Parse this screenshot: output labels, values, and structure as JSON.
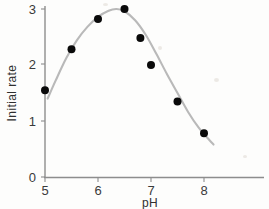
{
  "chart_data": {
    "type": "scatter",
    "title": "",
    "xlabel": "pH",
    "ylabel": "Initial rate",
    "xlim": [
      4.72,
      8.85
    ],
    "ylim": [
      0,
      3.12
    ],
    "xticks": [
      5,
      6,
      7,
      8
    ],
    "xtick_labels": [
      "5",
      "6",
      "7",
      "8"
    ],
    "yticks": [
      0,
      1,
      2,
      3
    ],
    "ytick_labels": [
      "0",
      "1",
      "2",
      "3"
    ],
    "grid": false,
    "legend": "none",
    "marker_color": "#0a0a0a",
    "curve_color": "#b9b9b9",
    "axis_color": "#8d8d8d",
    "points": [
      {
        "x": 5.0,
        "y": 1.55
      },
      {
        "x": 5.5,
        "y": 2.28
      },
      {
        "x": 6.0,
        "y": 2.82
      },
      {
        "x": 6.5,
        "y": 3.0
      },
      {
        "x": 6.8,
        "y": 2.48
      },
      {
        "x": 7.0,
        "y": 2.0
      },
      {
        "x": 7.5,
        "y": 1.35
      },
      {
        "x": 8.0,
        "y": 0.78
      }
    ],
    "fit_curve": [
      {
        "x": 5.05,
        "y": 1.4
      },
      {
        "x": 5.2,
        "y": 1.72
      },
      {
        "x": 5.4,
        "y": 2.12
      },
      {
        "x": 5.6,
        "y": 2.44
      },
      {
        "x": 5.8,
        "y": 2.68
      },
      {
        "x": 6.0,
        "y": 2.86
      },
      {
        "x": 6.2,
        "y": 2.97
      },
      {
        "x": 6.35,
        "y": 3.0
      },
      {
        "x": 6.5,
        "y": 2.96
      },
      {
        "x": 6.7,
        "y": 2.8
      },
      {
        "x": 6.9,
        "y": 2.54
      },
      {
        "x": 7.1,
        "y": 2.2
      },
      {
        "x": 7.3,
        "y": 1.84
      },
      {
        "x": 7.5,
        "y": 1.5
      },
      {
        "x": 7.7,
        "y": 1.16
      },
      {
        "x": 7.9,
        "y": 0.88
      },
      {
        "x": 8.1,
        "y": 0.66
      },
      {
        "x": 8.18,
        "y": 0.58
      }
    ]
  },
  "axes": {
    "x_axis_name": "pH",
    "y_axis_name": "Initial rate"
  }
}
